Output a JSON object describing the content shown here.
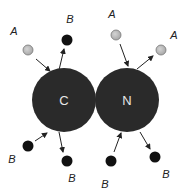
{
  "diagram": {
    "atoms": [
      {
        "id": "C",
        "label": "C",
        "cx": 64,
        "cy": 100,
        "r": 32,
        "color": "#2a2a2a"
      },
      {
        "id": "N",
        "label": "N",
        "cx": 127,
        "cy": 100,
        "r": 32,
        "color": "#2a2a2a"
      }
    ],
    "particles": [
      {
        "label": "A",
        "type": "A",
        "cx": 28,
        "cy": 50,
        "lx": 14,
        "ly": 35,
        "color": "#b8b8b8"
      },
      {
        "label": "B",
        "type": "B",
        "cx": 67,
        "cy": 40,
        "lx": 70,
        "ly": 23,
        "color": "#111111"
      },
      {
        "label": "A",
        "type": "A",
        "cx": 116,
        "cy": 35,
        "lx": 112,
        "ly": 18,
        "color": "#b8b8b8"
      },
      {
        "label": "A",
        "type": "A",
        "cx": 161,
        "cy": 50,
        "lx": 174,
        "ly": 39,
        "color": "#b8b8b8"
      },
      {
        "label": "B",
        "type": "B",
        "cx": 28,
        "cy": 146,
        "lx": 12,
        "ly": 163,
        "color": "#111111"
      },
      {
        "label": "B",
        "type": "B",
        "cx": 67,
        "cy": 161,
        "lx": 72,
        "ly": 182,
        "color": "#111111"
      },
      {
        "label": "B",
        "type": "B",
        "cx": 111,
        "cy": 161,
        "lx": 105,
        "ly": 188,
        "color": "#111111"
      },
      {
        "label": "B",
        "type": "B",
        "cx": 155,
        "cy": 157,
        "lx": 166,
        "ly": 178,
        "color": "#111111"
      }
    ],
    "arrows": [
      {
        "from": "A(top-left)",
        "to": "C",
        "x1": 36,
        "y1": 59,
        "x2": 50,
        "y2": 71
      },
      {
        "from": "C",
        "to": "B(top)",
        "x1": 59,
        "y1": 70,
        "x2": 64,
        "y2": 49
      },
      {
        "from": "A(top)",
        "to": "N",
        "x1": 120,
        "y1": 44,
        "x2": 128,
        "y2": 66
      },
      {
        "from": "N",
        "to": "A(right)",
        "x1": 137,
        "y1": 69,
        "x2": 153,
        "y2": 56
      },
      {
        "from": "B(bottom-left)",
        "to": "C",
        "x1": 35,
        "y1": 141,
        "x2": 47,
        "y2": 133
      },
      {
        "from": "C",
        "to": "B(bottom)",
        "x1": 59,
        "y1": 132,
        "x2": 63,
        "y2": 152
      },
      {
        "from": "B(bottom)",
        "to": "N",
        "x1": 114,
        "y1": 152,
        "x2": 121,
        "y2": 133
      },
      {
        "from": "N",
        "to": "B(bottom-right)",
        "x1": 140,
        "y1": 132,
        "x2": 150,
        "y2": 149
      }
    ]
  }
}
